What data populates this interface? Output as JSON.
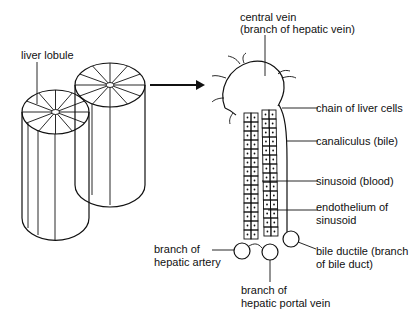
{
  "labels": {
    "liver_lobule": "liver lobule",
    "central_vein_1": "central vein",
    "central_vein_2": "(branch of hepatic vein)",
    "chain_of_liver_cells": "chain of liver cells",
    "canaliculus": "canaliculus (bile)",
    "sinusoid": "sinusoid (blood)",
    "endothelium_1": "endothelium of",
    "endothelium_2": "sinusoid",
    "hepatic_artery_1": "branch of",
    "hepatic_artery_2": "hepatic artery",
    "bile_ductile_1": "bile ductile (branch",
    "bile_ductile_2": "of bile duct)",
    "portal_vein_1": "branch of",
    "portal_vein_2": "hepatic portal vein"
  },
  "colors": {
    "line": "#111111",
    "background": "#ffffff"
  }
}
